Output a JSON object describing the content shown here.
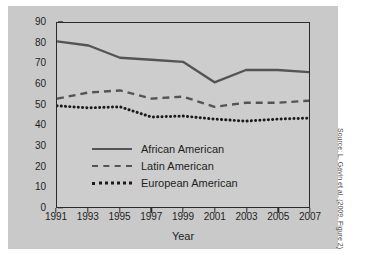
{
  "chart_data": {
    "type": "line",
    "title": "",
    "xlabel": "Year",
    "ylabel": "Percentage",
    "grid": false,
    "legend_position": "inside-lower-left",
    "x": [
      1991,
      1993,
      1995,
      1997,
      1999,
      2001,
      2003,
      2005,
      2007
    ],
    "xlim": [
      1991,
      2007
    ],
    "ylim": [
      0,
      90
    ],
    "ytick_labels": [
      "0",
      "10",
      "20",
      "30",
      "40",
      "50",
      "60",
      "70",
      "80",
      "90"
    ],
    "ytick_values": [
      0,
      10,
      20,
      30,
      40,
      50,
      60,
      70,
      80,
      90
    ],
    "xtick_labels": [
      "1991",
      "1993",
      "1995",
      "1997",
      "1999",
      "2001",
      "2003",
      "2005",
      "2007"
    ],
    "series": [
      {
        "name": "African American",
        "style": "solid",
        "color": "#545454",
        "values": [
          81,
          79,
          73,
          72,
          71,
          61,
          67,
          67,
          66
        ]
      },
      {
        "name": "Latin American",
        "style": "dashed",
        "color": "#545454",
        "values": [
          53,
          56,
          57,
          53,
          54,
          49,
          51,
          51,
          52
        ]
      },
      {
        "name": "European American",
        "style": "dotted",
        "color": "#1a1a1a",
        "values": [
          49.5,
          48.5,
          49,
          44,
          44.5,
          43,
          42,
          43,
          43.5
        ]
      }
    ],
    "source_credit": "Source: L. Gavin et al. (2009, Figure 2)"
  }
}
